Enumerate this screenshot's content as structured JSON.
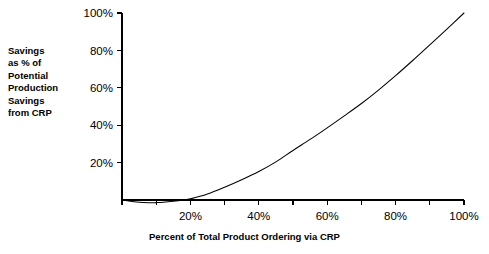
{
  "chart_data": {
    "type": "line",
    "title": "",
    "xlabel": "Percent of Total Product Ordering via CRP",
    "ylabel": "Savings as % of Potential Production Savings from CRP",
    "ylabel_lines": [
      "Savings",
      "as % of",
      "Potential",
      "Production",
      "Savings",
      "from CRP"
    ],
    "xlim": [
      0,
      100
    ],
    "ylim": [
      -5,
      100
    ],
    "grid": false,
    "legend": false,
    "x_tick_labels": [
      "20%",
      "40%",
      "60%",
      "80%",
      "100%"
    ],
    "x_tick_values": [
      20,
      40,
      60,
      80,
      100
    ],
    "x_minor_tick_values": [
      0,
      10,
      20,
      30,
      40,
      50,
      60,
      70,
      80,
      90,
      100
    ],
    "y_tick_labels": [
      "20%",
      "40%",
      "60%",
      "80%",
      "100%"
    ],
    "y_tick_values": [
      20,
      40,
      60,
      80,
      100
    ],
    "axis_color": "#000000",
    "curve_color": "#000000",
    "background_color": "#ffffff",
    "series": [
      {
        "name": "Savings curve",
        "x": [
          0,
          5,
          8,
          10,
          12,
          15,
          18,
          20,
          25,
          30,
          35,
          40,
          45,
          50,
          55,
          60,
          65,
          70,
          75,
          80,
          85,
          90,
          95,
          100
        ],
        "y": [
          0,
          -1.2,
          -1.5,
          -1.4,
          -1.2,
          -0.7,
          0,
          0.6,
          3.2,
          6.8,
          10.8,
          15.2,
          20.4,
          26.5,
          32.4,
          38.6,
          45.0,
          51.6,
          58.8,
          66.5,
          74.6,
          83.0,
          91.4,
          100
        ]
      }
    ]
  },
  "geometry": {
    "plot_left": 122,
    "plot_right": 464,
    "plot_top": 13,
    "plot_bottom": 200
  }
}
